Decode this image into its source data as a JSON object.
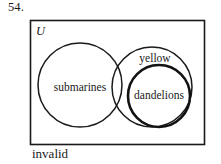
{
  "question": {
    "number": "54."
  },
  "diagram": {
    "universe_label": "U",
    "sets": [
      {
        "id": "submarines",
        "label": "submarines"
      },
      {
        "id": "yellow",
        "label": "yellow"
      },
      {
        "id": "dandelions",
        "label": "dandelions"
      }
    ]
  },
  "answer": {
    "verdict": "invalid"
  },
  "colors": {
    "ink": "#1a1a1a",
    "background": "#ffffff"
  }
}
